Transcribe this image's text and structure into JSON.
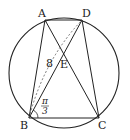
{
  "diagram": {
    "type": "geometry",
    "circle": {
      "cx": 64,
      "cy": 73,
      "r": 55
    },
    "points": {
      "A": {
        "label": "A",
        "x": 45,
        "y": 20
      },
      "D": {
        "label": "D",
        "x": 82,
        "y": 20
      },
      "B": {
        "label": "B",
        "x": 29,
        "y": 118
      },
      "C": {
        "label": "C",
        "x": 99,
        "y": 118
      },
      "E": {
        "label": "E",
        "x": 63,
        "y": 56
      }
    },
    "segments": [
      "AD",
      "AB",
      "BC",
      "CD",
      "AC",
      "BD"
    ],
    "dashed_segments": [
      "BD (arc/chord)"
    ],
    "annotations": {
      "length_label": "8",
      "angle_label_num": "π",
      "angle_label_den": "3",
      "angle_at": "B"
    }
  }
}
